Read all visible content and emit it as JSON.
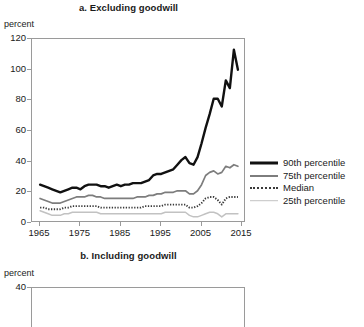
{
  "figure": {
    "panels": [
      {
        "id": "panel-a",
        "title": "a. Excluding goodwill",
        "unit_label": "percent"
      },
      {
        "id": "panel-b",
        "title": "b. Including goodwill",
        "unit_label": "percent"
      }
    ]
  },
  "legend": {
    "items": [
      {
        "label": "90th percentile",
        "style": "solid-thick",
        "color": "#111111"
      },
      {
        "label": "75th percentile",
        "style": "solid-medium",
        "color": "#7d7d7d"
      },
      {
        "label": "Median",
        "style": "dotted",
        "color": "#3a3a3a"
      },
      {
        "label": "25th percentile",
        "style": "solid-thin",
        "color": "#c2c2c2"
      }
    ]
  },
  "chart_data": [
    {
      "type": "line",
      "title": "a. Excluding goodwill",
      "xlabel": "",
      "ylabel": "percent",
      "xlim": [
        1963,
        2016
      ],
      "ylim": [
        0,
        120
      ],
      "ytick_values": [
        0,
        20,
        40,
        60,
        80,
        100,
        120
      ],
      "xtick_values": [
        1965,
        1975,
        1985,
        1995,
        2005,
        2015
      ],
      "grid": false,
      "legend_position": "right",
      "x": [
        1965,
        1966,
        1967,
        1968,
        1969,
        1970,
        1971,
        1972,
        1973,
        1974,
        1975,
        1976,
        1977,
        1978,
        1979,
        1980,
        1981,
        1982,
        1983,
        1984,
        1985,
        1986,
        1987,
        1988,
        1989,
        1990,
        1991,
        1992,
        1993,
        1994,
        1995,
        1996,
        1997,
        1998,
        1999,
        2000,
        2001,
        2002,
        2003,
        2004,
        2005,
        2006,
        2007,
        2008,
        2009,
        2010,
        2011,
        2012,
        2013,
        2014
      ],
      "series": [
        {
          "name": "90th percentile",
          "values": [
            25,
            24,
            23,
            22,
            21,
            20,
            21,
            22,
            23,
            23,
            22,
            24,
            25,
            25,
            25,
            24,
            24,
            23,
            24,
            25,
            24,
            25,
            25,
            26,
            26,
            26,
            27,
            28,
            31,
            32,
            32,
            33,
            34,
            35,
            38,
            41,
            43,
            39,
            38,
            43,
            52,
            62,
            71,
            81,
            81,
            76,
            93,
            88,
            113,
            100
          ]
        },
        {
          "name": "75th percentile",
          "values": [
            16,
            15,
            14,
            13,
            13,
            13,
            14,
            15,
            16,
            17,
            17,
            17,
            18,
            18,
            17,
            17,
            16,
            16,
            16,
            16,
            16,
            16,
            16,
            16,
            17,
            17,
            17,
            18,
            18,
            19,
            19,
            20,
            20,
            20,
            21,
            21,
            21,
            19,
            19,
            21,
            25,
            31,
            33,
            34,
            32,
            33,
            37,
            36,
            38,
            37
          ]
        },
        {
          "name": "Median",
          "values": [
            10,
            10,
            9,
            9,
            9,
            9,
            10,
            10,
            11,
            11,
            11,
            11,
            11,
            11,
            11,
            10,
            10,
            10,
            10,
            10,
            10,
            10,
            10,
            10,
            10,
            10,
            11,
            11,
            11,
            11,
            11,
            12,
            12,
            12,
            12,
            12,
            12,
            10,
            10,
            11,
            13,
            16,
            17,
            17,
            15,
            12,
            16,
            17,
            17,
            17
          ]
        },
        {
          "name": "25th percentile",
          "values": [
            8,
            7,
            6,
            5,
            5,
            5,
            6,
            6,
            7,
            7,
            7,
            7,
            7,
            7,
            7,
            6,
            6,
            6,
            6,
            6,
            6,
            6,
            6,
            6,
            6,
            6,
            6,
            6,
            6,
            6,
            6,
            7,
            7,
            7,
            7,
            7,
            7,
            5,
            4,
            4,
            5,
            6,
            7,
            7,
            6,
            4,
            6,
            6,
            6,
            6
          ]
        }
      ]
    },
    {
      "type": "line",
      "title": "b. Including goodwill",
      "xlabel": "",
      "ylabel": "percent",
      "ylim": [
        0,
        40
      ],
      "ytick_values": [
        40
      ],
      "grid": false,
      "note": "panel cropped at bottom of screenshot; only top frame and 40 tick visible",
      "series": []
    }
  ]
}
